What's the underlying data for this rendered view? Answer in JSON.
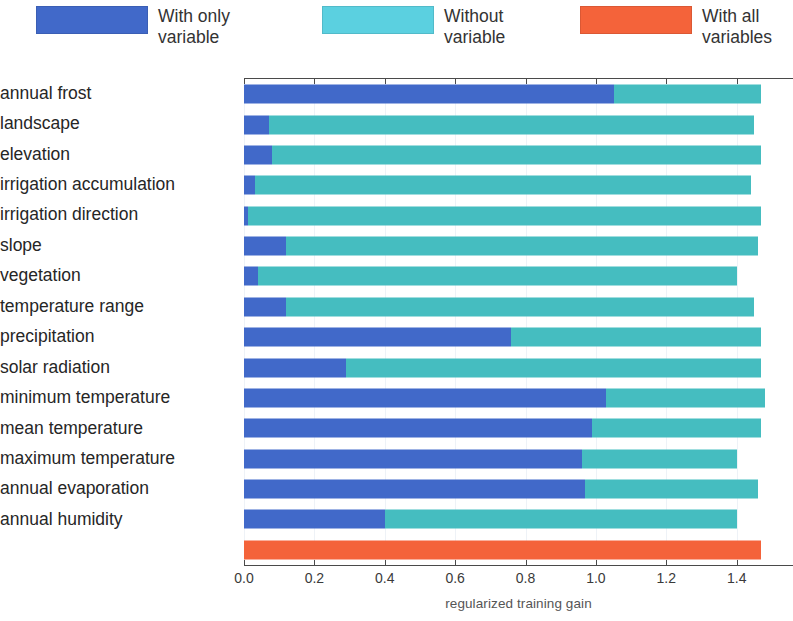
{
  "legend": {
    "position": "top",
    "entries": [
      {
        "label": "With only\nvariable",
        "color": "#4169C9",
        "key": "with_only_variable"
      },
      {
        "label": "Without\nvariable",
        "color": "#45BDC0",
        "key": "without_variable"
      },
      {
        "label": "With all\nvariables",
        "color": "#F4633A",
        "key": "with_all_variables"
      }
    ]
  },
  "chart_data": {
    "type": "bar",
    "orientation": "horizontal",
    "stacked": false,
    "title": "",
    "subtitle": "",
    "xlabel": "regularized training gain",
    "ylabel": "",
    "xlim": [
      0.0,
      1.56
    ],
    "xticks": [
      0.0,
      0.2,
      0.4,
      0.6,
      0.8,
      1.0,
      1.2,
      1.4
    ],
    "xticklabels": [
      "0.0",
      "0.2",
      "0.4",
      "0.6",
      "0.8",
      "1.0",
      "1.2",
      "1.4"
    ],
    "grid": "vertical-light",
    "axis_position": "top-and-bottom",
    "categories": [
      "annual frost",
      "landscape",
      "elevation",
      "irrigation accumulation",
      "irrigation direction",
      "slope",
      "vegetation",
      "temperature range",
      "precipitation",
      "solar radiation",
      "minimum temperature",
      "mean temperature",
      "maximum temperature",
      "annual evaporation",
      "annual humidity"
    ],
    "series": [
      {
        "name": "With only variable",
        "color": "#4169C9",
        "values": [
          1.05,
          0.07,
          0.08,
          0.03,
          0.01,
          0.12,
          0.04,
          0.12,
          0.76,
          0.29,
          1.03,
          0.99,
          0.96,
          0.97,
          0.4
        ]
      },
      {
        "name": "Without variable",
        "color": "#45BDC0",
        "values": [
          1.47,
          1.45,
          1.47,
          1.44,
          1.47,
          1.46,
          1.4,
          1.45,
          1.47,
          1.47,
          1.48,
          1.47,
          1.4,
          1.46,
          1.4
        ]
      }
    ],
    "overall_bar": {
      "name": "With all variables",
      "color": "#F4633A",
      "value": 1.47
    }
  }
}
